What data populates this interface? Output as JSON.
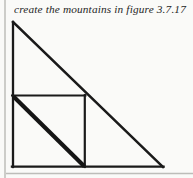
{
  "page": {
    "background_color": "#fafaf8",
    "ink_color": "#1a1a1a",
    "rule_color": "#b9b9b5",
    "width": 193,
    "height": 178
  },
  "caption": {
    "text": "create the mountains in figure 3.7.17",
    "style": "italic-serif"
  },
  "figure": {
    "name": "sierpinski-mountain-construction",
    "outer_triangle": {
      "apex": [
        12,
        22
      ],
      "bottom_left": [
        12,
        167
      ],
      "bottom_right": [
        163,
        167
      ],
      "stroke_width": 2.4
    },
    "inner_square": {
      "top_left": [
        12,
        95
      ],
      "top_right": [
        85,
        95
      ],
      "bottom_right": [
        85,
        167
      ],
      "bottom_left": [
        12,
        167
      ],
      "stroke_width": 2.0
    },
    "thick_diagonal": {
      "from": [
        13,
        96
      ],
      "to": [
        85,
        167
      ],
      "stroke_width": 4.2
    },
    "margin_rule_vertical_x": 5,
    "margin_rule_horizontal_y": 173
  }
}
